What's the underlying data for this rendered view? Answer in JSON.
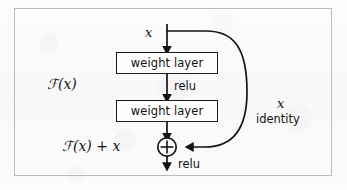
{
  "figure": {
    "name": "residual-learning-building-block",
    "background_color": "#fbfbfb",
    "frame_color": "#b9bcc2",
    "ink_color": "#141414"
  },
  "diagram": {
    "type": "flow-diagram",
    "nodes": [
      {
        "id": "weight-layer-1",
        "label": "weight layer",
        "shape": "rectangle"
      },
      {
        "id": "weight-layer-2",
        "label": "weight layer",
        "shape": "rectangle"
      },
      {
        "id": "addition",
        "label": "+",
        "shape": "circle-plus"
      }
    ],
    "labels": {
      "input_x": "x",
      "function_fx": "ℱ(x)",
      "relu_middle": "relu",
      "output_sum": "ℱ(x) + x",
      "relu_bottom": "relu",
      "shortcut_x": "x",
      "shortcut_identity": "identity"
    },
    "edges": [
      {
        "from": "input",
        "to": "weight-layer-1",
        "style": "arrow-down"
      },
      {
        "from": "weight-layer-1",
        "to": "weight-layer-2",
        "style": "arrow-down",
        "annotation": "relu"
      },
      {
        "from": "weight-layer-2",
        "to": "addition",
        "style": "arrow-down"
      },
      {
        "from": "input",
        "to": "addition",
        "style": "curved-skip-arrow",
        "annotation": "identity"
      },
      {
        "from": "addition",
        "to": "output",
        "style": "arrow-down",
        "annotation": "relu"
      }
    ]
  }
}
